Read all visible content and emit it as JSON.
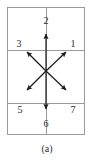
{
  "figure": {
    "caption": "(a)",
    "colors": {
      "grid": "#9a9a9a",
      "arrow": "#1a1a1a",
      "label": "#2b2b2b",
      "background": "#ffffff"
    },
    "frame": {
      "left": 7,
      "top": 7,
      "right": 85,
      "bottom": 135,
      "horizontal_dividers": [
        50,
        103
      ],
      "vertical_divider": 46
    },
    "center": {
      "x": 46,
      "y": 71
    },
    "directions": [
      {
        "id": "1",
        "label": "1",
        "heading": "upper-right",
        "label_x": 73,
        "label_y": 40,
        "tip_x": 66,
        "tip_y": 51
      },
      {
        "id": "2",
        "label": "2",
        "heading": "up",
        "label_x": 46,
        "label_y": 16,
        "tip_x": 46,
        "tip_y": 33
      },
      {
        "id": "3",
        "label": "3",
        "heading": "upper-left",
        "label_x": 19,
        "label_y": 40,
        "tip_x": 26,
        "tip_y": 51
      },
      {
        "id": "5",
        "label": "5",
        "heading": "lower-left",
        "label_x": 20,
        "label_y": 106,
        "tip_x": 26,
        "tip_y": 91
      },
      {
        "id": "6",
        "label": "6",
        "heading": "down",
        "label_x": 46,
        "label_y": 120,
        "tip_x": 46,
        "tip_y": 110
      },
      {
        "id": "7",
        "label": "7",
        "heading": "lower-right",
        "label_x": 73,
        "label_y": 106,
        "tip_x": 66,
        "tip_y": 91
      }
    ]
  }
}
